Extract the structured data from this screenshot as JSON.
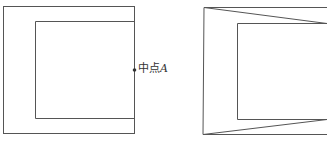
{
  "diagram": {
    "left_figure": {
      "outer_rect": {
        "x1": 3,
        "y1": 6,
        "x2": 135,
        "y2": 134
      },
      "inner_rect": {
        "x1": 35,
        "y1": 21,
        "x2": 135,
        "y2": 118
      },
      "midpoint": {
        "x": 134,
        "y": 70,
        "label_text": "中点",
        "label_var": "A"
      }
    },
    "right_figure": {
      "outer_left": {
        "x_top": 204,
        "x_bottom": 203,
        "y_top": 7,
        "y_bottom": 134
      },
      "inner_rect": {
        "x1": 237,
        "y1": 23,
        "x2": 327,
        "y2": 119
      },
      "diagonals": [
        {
          "from": [
            204,
            7
          ],
          "to": [
            327,
            23
          ]
        },
        {
          "from": [
            203,
            134
          ],
          "to": [
            327,
            119
          ]
        }
      ]
    },
    "stroke_color": "#555555"
  }
}
